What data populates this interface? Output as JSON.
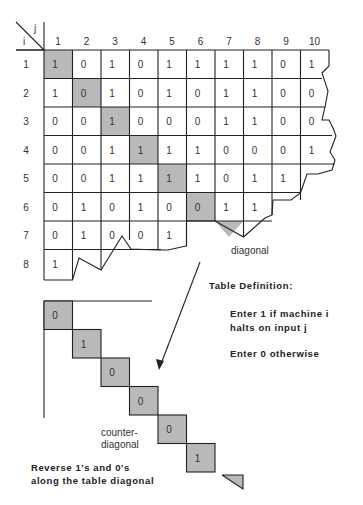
{
  "figure": {
    "header": {
      "row_axis": "i",
      "col_axis": "j"
    },
    "columns": [
      "1",
      "2",
      "3",
      "4",
      "5",
      "6",
      "7",
      "8",
      "9",
      "10"
    ],
    "rows": [
      {
        "label": "1",
        "values": [
          "1",
          "0",
          "1",
          "0",
          "1",
          "1",
          "1",
          "1",
          "0",
          "1"
        ]
      },
      {
        "label": "2",
        "values": [
          "1",
          "0",
          "1",
          "0",
          "1",
          "0",
          "1",
          "1",
          "0",
          "0"
        ]
      },
      {
        "label": "3",
        "values": [
          "0",
          "0",
          "1",
          "0",
          "0",
          "0",
          "1",
          "1",
          "0",
          "0"
        ]
      },
      {
        "label": "4",
        "values": [
          "0",
          "0",
          "1",
          "1",
          "1",
          "1",
          "0",
          "0",
          "0",
          "1"
        ]
      },
      {
        "label": "5",
        "values": [
          "0",
          "0",
          "1",
          "1",
          "1",
          "1",
          "0",
          "1",
          "1"
        ]
      },
      {
        "label": "6",
        "values": [
          "0",
          "1",
          "0",
          "1",
          "0",
          "0",
          "1",
          "1"
        ]
      },
      {
        "label": "7",
        "values": [
          "0",
          "1",
          "0",
          "0",
          "1"
        ]
      },
      {
        "label": "8",
        "values": [
          "1"
        ]
      }
    ],
    "diagonal_label": "diagonal",
    "definition": {
      "title": "Table Definition:",
      "line1a": "Enter 1 if machine i",
      "line1b": "halts on input j",
      "line2": "Enter 0 otherwise"
    },
    "counter_diagonal": {
      "values": [
        "0",
        "1",
        "0",
        "0",
        "0",
        "1"
      ],
      "label_line1": "counter-",
      "label_line2": "diagonal"
    },
    "caption": {
      "line1": "Reverse 1's and 0's",
      "line2": "along the table diagonal"
    },
    "colors": {
      "shade": "#b9b9b9",
      "line": "#222222"
    }
  }
}
